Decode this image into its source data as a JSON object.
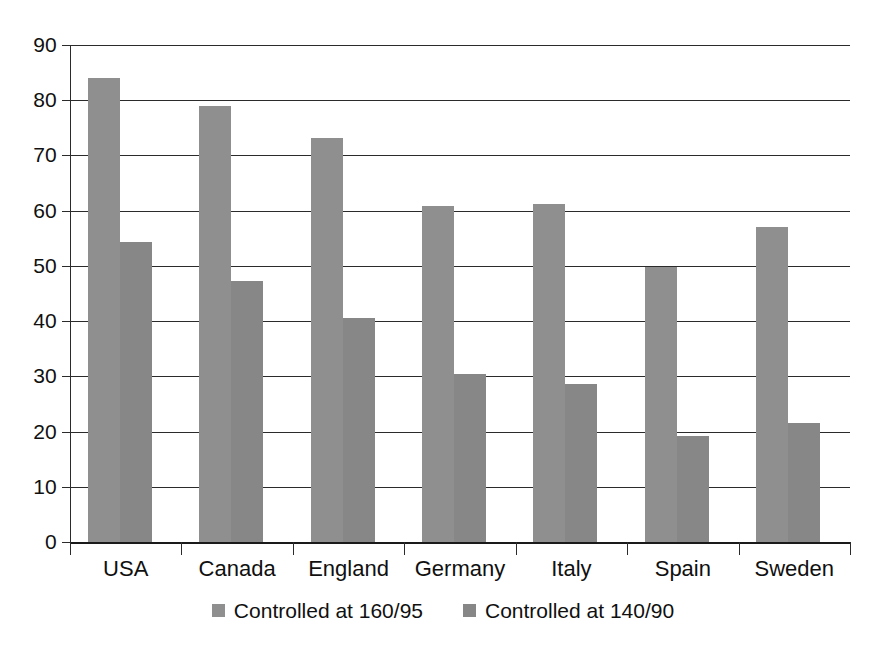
{
  "chart_data": {
    "type": "bar",
    "title": "",
    "subtitle": "",
    "xlabel": "",
    "ylabel": "",
    "categories": [
      "USA",
      "Canada",
      "England",
      "Germany",
      "Italy",
      "Spain",
      "Sweden"
    ],
    "series": [
      {
        "name": "Controlled at 160/95",
        "color": "#8f8f8f",
        "values": [
          84.0,
          79.0,
          73.2,
          60.8,
          61.2,
          49.8,
          57.0
        ]
      },
      {
        "name": "Controlled at 140/90",
        "color": "#878787",
        "values": [
          54.4,
          47.3,
          40.5,
          30.4,
          28.6,
          19.2,
          21.5
        ]
      }
    ],
    "ylim": [
      0,
      90
    ],
    "ytick_step": 10,
    "yticks": [
      "0",
      "10",
      "20",
      "30",
      "40",
      "50",
      "60",
      "70",
      "80",
      "90"
    ],
    "grid": true,
    "grid_axis": "y",
    "legend_position": "bottom-center",
    "annotations": []
  },
  "axes": {
    "y_axis_name": "y-axis",
    "x_axis_name": "x-axis"
  },
  "colors": {
    "background": "#ffffff",
    "axis": "#2b2b2b",
    "text": "#101010",
    "series_1": "#8f8f8f",
    "series_2": "#878787"
  }
}
